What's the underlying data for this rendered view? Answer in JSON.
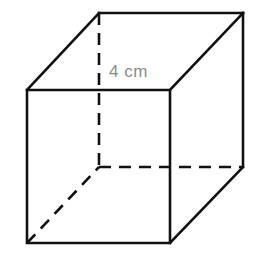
{
  "figure": {
    "shape_name": "cube",
    "background_color": "#ffffff",
    "canvas": {
      "width": 258,
      "height": 261
    }
  },
  "labels": {
    "edge_length": {
      "text": "4 cm",
      "value": 4,
      "unit": "cm",
      "color": "#8c8c8c",
      "font_size_px": 17,
      "x": 109,
      "y": 62
    }
  },
  "style": {
    "solid_edge_color": "#111111",
    "solid_edge_width": 2.6,
    "hidden_edge_color": "#111111",
    "hidden_edge_width": 2.6,
    "hidden_dash_pattern": "12 8"
  },
  "geometry": {
    "description": "Isometric-style cube drawn as two overlapping squares joined by four oblique edges",
    "vertices": {
      "front_top_left": {
        "x": 27,
        "y": 90
      },
      "front_top_right": {
        "x": 170,
        "y": 90
      },
      "front_bottom_right": {
        "x": 170,
        "y": 243
      },
      "front_bottom_left": {
        "x": 27,
        "y": 243
      },
      "back_top_left": {
        "x": 99,
        "y": 13
      },
      "back_top_right": {
        "x": 243,
        "y": 13
      },
      "back_bottom_right": {
        "x": 243,
        "y": 167
      },
      "back_bottom_left": {
        "x": 99,
        "y": 167
      }
    },
    "solid_edges": {
      "front_face": "M 27 90 L 170 90 L 170 243 L 27 243 Z",
      "back_top": "M 99 13 L 243 13",
      "back_right": "M 243 13 L 243 167",
      "connector_top_left": "M 27 90 L 99 13",
      "connector_top_right": "M 170 90 L 243 13",
      "connector_bottom_right": "M 170 243 L 243 167"
    },
    "hidden_edges": {
      "back_left_vertical": "M 99 13 L 99 167",
      "back_bottom_horizontal": "M 99 167 L 243 167",
      "connector_bottom_left": "M 27 243 L 99 167"
    }
  }
}
